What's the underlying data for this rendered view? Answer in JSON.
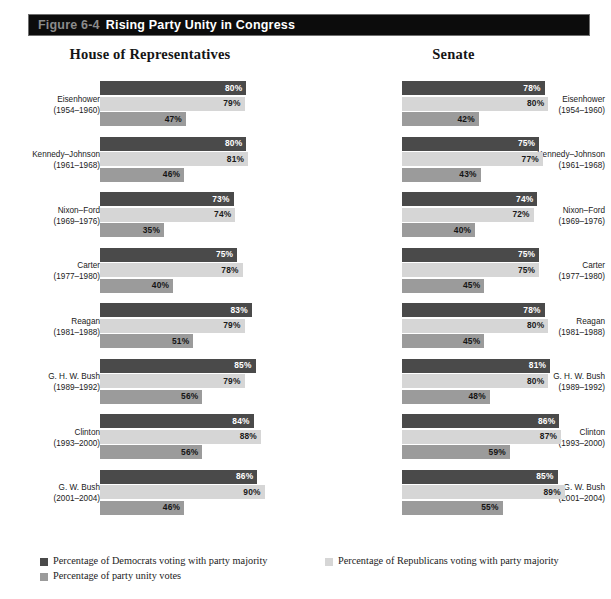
{
  "banner": {
    "figure_number": "Figure 6-4",
    "title": "Rising Party Unity in Congress"
  },
  "legend": {
    "democrats": "Percentage of Democrats voting with party majority",
    "republicans": "Percentage of Republicans voting with party majority",
    "unity": "Percentage of party unity votes",
    "colors": {
      "democrats": "#4a4a4a",
      "republicans": "#d6d6d6",
      "unity": "#9b9b9b"
    }
  },
  "chart_data": {
    "type": "bar",
    "title": "Rising Party Unity in Congress",
    "xlabel": "",
    "ylabel": "",
    "xlim": [
      0,
      100
    ],
    "grid": false,
    "orientation": "horizontal",
    "legend_position": "bottom",
    "panels": [
      {
        "name": "House of Representatives",
        "categories": [
          "Eisenhower (1954–1960)",
          "Kennedy–Johnson (1961–1968)",
          "Nixon–Ford (1969–1976)",
          "Carter (1977–1980)",
          "Reagan (1981–1988)",
          "G. H. W. Bush (1989–1992)",
          "Clinton (1993–2000)",
          "G. W. Bush (2001–2004)"
        ],
        "series": [
          {
            "name": "Percentage of Democrats voting with party majority",
            "values": [
              80,
              80,
              73,
              75,
              83,
              85,
              84,
              86
            ]
          },
          {
            "name": "Percentage of Republicans voting with party majority",
            "values": [
              79,
              81,
              74,
              78,
              79,
              79,
              88,
              90
            ]
          },
          {
            "name": "Percentage of party unity votes",
            "values": [
              47,
              46,
              35,
              40,
              51,
              56,
              56,
              46
            ]
          }
        ],
        "groups": [
          {
            "label_name": "Eisenhower",
            "label_years": "(1954–1960)",
            "dem": 80,
            "rep": 79,
            "unity": 47,
            "dem_text": "80%",
            "rep_text": "79%",
            "unity_text": "47%"
          },
          {
            "label_name": "Kennedy–Johnson",
            "label_years": "(1961–1968)",
            "dem": 80,
            "rep": 81,
            "unity": 46,
            "dem_text": "80%",
            "rep_text": "81%",
            "unity_text": "46%"
          },
          {
            "label_name": "Nixon–Ford",
            "label_years": "(1969–1976)",
            "dem": 73,
            "rep": 74,
            "unity": 35,
            "dem_text": "73%",
            "rep_text": "74%",
            "unity_text": "35%"
          },
          {
            "label_name": "Carter",
            "label_years": "(1977–1980)",
            "dem": 75,
            "rep": 78,
            "unity": 40,
            "dem_text": "75%",
            "rep_text": "78%",
            "unity_text": "40%"
          },
          {
            "label_name": "Reagan",
            "label_years": "(1981–1988)",
            "dem": 83,
            "rep": 79,
            "unity": 51,
            "dem_text": "83%",
            "rep_text": "79%",
            "unity_text": "51%"
          },
          {
            "label_name": "G. H. W. Bush",
            "label_years": "(1989–1992)",
            "dem": 85,
            "rep": 79,
            "unity": 56,
            "dem_text": "85%",
            "rep_text": "79%",
            "unity_text": "56%"
          },
          {
            "label_name": "Clinton",
            "label_years": "(1993–2000)",
            "dem": 84,
            "rep": 88,
            "unity": 56,
            "dem_text": "84%",
            "rep_text": "88%",
            "unity_text": "56%"
          },
          {
            "label_name": "G. W. Bush",
            "label_years": "(2001–2004)",
            "dem": 86,
            "rep": 90,
            "unity": 46,
            "dem_text": "86%",
            "rep_text": "90%",
            "unity_text": "46%"
          }
        ]
      },
      {
        "name": "Senate",
        "categories": [
          "Eisenhower (1954–1960)",
          "Kennedy–Johnson (1961–1968)",
          "Nixon–Ford (1969–1976)",
          "Carter (1977–1980)",
          "Reagan (1981–1988)",
          "G. H. W. Bush (1989–1992)",
          "Clinton (1993–2000)",
          "G. W. Bush (2001–2004)"
        ],
        "series": [
          {
            "name": "Percentage of Democrats voting with party majority",
            "values": [
              78,
              75,
              74,
              75,
              78,
              81,
              86,
              85
            ]
          },
          {
            "name": "Percentage of Republicans voting with party majority",
            "values": [
              80,
              77,
              72,
              75,
              80,
              80,
              87,
              89
            ]
          },
          {
            "name": "Percentage of party unity votes",
            "values": [
              42,
              43,
              40,
              45,
              45,
              48,
              59,
              55
            ]
          }
        ],
        "groups": [
          {
            "label_name": "Eisenhower",
            "label_years": "(1954–1960)",
            "dem": 78,
            "rep": 80,
            "unity": 42,
            "dem_text": "78%",
            "rep_text": "80%",
            "unity_text": "42%"
          },
          {
            "label_name": "Kennedy–Johnson",
            "label_years": "(1961–1968)",
            "dem": 75,
            "rep": 77,
            "unity": 43,
            "dem_text": "75%",
            "rep_text": "77%",
            "unity_text": "43%"
          },
          {
            "label_name": "Nixon–Ford",
            "label_years": "(1969–1976)",
            "dem": 74,
            "rep": 72,
            "unity": 40,
            "dem_text": "74%",
            "rep_text": "72%",
            "unity_text": "40%"
          },
          {
            "label_name": "Carter",
            "label_years": "(1977–1980)",
            "dem": 75,
            "rep": 75,
            "unity": 45,
            "dem_text": "75%",
            "rep_text": "75%",
            "unity_text": "45%"
          },
          {
            "label_name": "Reagan",
            "label_years": "(1981–1988)",
            "dem": 78,
            "rep": 80,
            "unity": 45,
            "dem_text": "78%",
            "rep_text": "80%",
            "unity_text": "45%"
          },
          {
            "label_name": "G. H. W. Bush",
            "label_years": "(1989–1992)",
            "dem": 81,
            "rep": 80,
            "unity": 48,
            "dem_text": "81%",
            "rep_text": "80%",
            "unity_text": "48%"
          },
          {
            "label_name": "Clinton",
            "label_years": "(1993–2000)",
            "dem": 86,
            "rep": 87,
            "unity": 59,
            "dem_text": "86%",
            "rep_text": "87%",
            "unity_text": "59%"
          },
          {
            "label_name": "G. W. Bush",
            "label_years": "(2001–2004)",
            "dem": 85,
            "rep": 89,
            "unity": 55,
            "dem_text": "85%",
            "rep_text": "89%",
            "unity_text": "55%"
          }
        ]
      }
    ]
  }
}
